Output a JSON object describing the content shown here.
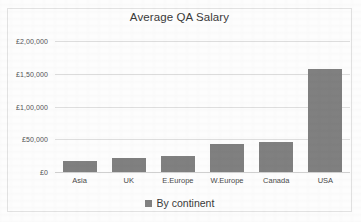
{
  "chart_data": {
    "type": "bar",
    "title": "Average QA Salary",
    "xlabel": "",
    "ylabel": "",
    "categories": [
      "Asia",
      "UK",
      "E.Europe",
      "W.Europe",
      "Canada",
      "USA"
    ],
    "values": [
      17000,
      22000,
      25000,
      43000,
      46000,
      158000
    ],
    "series": [
      {
        "name": "By continent",
        "values": [
          17000,
          22000,
          25000,
          43000,
          46000,
          158000
        ]
      }
    ],
    "ylim": [
      0,
      200000
    ],
    "ytick_values": [
      0,
      50000,
      100000,
      150000,
      200000
    ],
    "ytick_labels": [
      "£0",
      "£50,000",
      "£1,00,000",
      "£1,50,000",
      "£2,00,000"
    ],
    "grid": true,
    "legend": {
      "position": "bottom",
      "entries": [
        "By continent"
      ]
    },
    "colors": {
      "bar": "#808080",
      "gridline": "#dedede",
      "axis": "#d2d2d2",
      "title_text": "#3a3a3a",
      "tick_text": "#555555",
      "frame_border": "#e2e2e2",
      "background": "#fdfdfd"
    }
  }
}
